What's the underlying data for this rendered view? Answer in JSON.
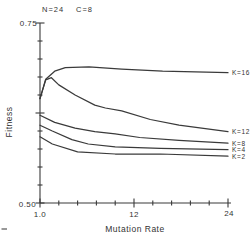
{
  "figure": {
    "title_left": "N=24",
    "title_right": "C=8",
    "ylabel": "Fitness",
    "xlabel": "Mutation Rate",
    "y_top_label": "0.75",
    "y_bottom_label": "0.50",
    "x_tick_labels": [
      "1.0",
      "12",
      "24"
    ]
  },
  "chart_data": {
    "type": "line",
    "title": "N=24  C=8",
    "xlabel": "Mutation Rate",
    "ylabel": "Fitness",
    "xlim": [
      1.0,
      24
    ],
    "ylim": [
      0.5,
      0.75
    ],
    "x_major_tick_values": [
      1.0,
      12,
      24
    ],
    "x_tick_labels": [
      "1.0",
      "12",
      "24"
    ],
    "y_major_tick_values": [
      0.75,
      0.625,
      0.5
    ],
    "y_tick_labels": [
      "0.75",
      "0.50"
    ],
    "minor_ticks_x": 11,
    "minor_ticks_y": 11,
    "grid": false,
    "legend_position": "right-of-line-ends",
    "ink_color": "#3a3a3a",
    "background_color": "#ffffff",
    "series": [
      {
        "name": "K=16",
        "points": [
          [
            1.0,
            0.645
          ],
          [
            1.7,
            0.672
          ],
          [
            2.8,
            0.683
          ],
          [
            4.1,
            0.688
          ],
          [
            7,
            0.689
          ],
          [
            11,
            0.686
          ],
          [
            16,
            0.683
          ],
          [
            24,
            0.681
          ]
        ]
      },
      {
        "name": "K=12",
        "points": [
          [
            1.0,
            0.645
          ],
          [
            1.7,
            0.671
          ],
          [
            2.4,
            0.674
          ],
          [
            3.3,
            0.664
          ],
          [
            5.3,
            0.65
          ],
          [
            7.7,
            0.636
          ],
          [
            9,
            0.632
          ],
          [
            11,
            0.628
          ],
          [
            14.5,
            0.616
          ],
          [
            18,
            0.608
          ],
          [
            24,
            0.599
          ]
        ]
      },
      {
        "name": "K=8",
        "points": [
          [
            1.0,
            0.622
          ],
          [
            2.8,
            0.612
          ],
          [
            5.3,
            0.604
          ],
          [
            7.7,
            0.599
          ],
          [
            10.2,
            0.596
          ],
          [
            13.2,
            0.591
          ],
          [
            18,
            0.587
          ],
          [
            24,
            0.583
          ]
        ]
      },
      {
        "name": "K=4",
        "points": [
          [
            1.0,
            0.608
          ],
          [
            2.5,
            0.6
          ],
          [
            4.9,
            0.588
          ],
          [
            6.9,
            0.582
          ],
          [
            10.2,
            0.578
          ],
          [
            15.7,
            0.576
          ],
          [
            24,
            0.574
          ]
        ]
      },
      {
        "name": "K=2",
        "points": [
          [
            1.0,
            0.592
          ],
          [
            2.5,
            0.582
          ],
          [
            5.6,
            0.571
          ],
          [
            10.2,
            0.568
          ],
          [
            15.7,
            0.568
          ],
          [
            24,
            0.565
          ]
        ]
      }
    ]
  }
}
